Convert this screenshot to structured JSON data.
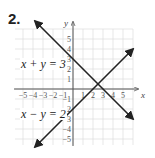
{
  "problem_number": "2.",
  "chart_data": {
    "type": "line",
    "title": "",
    "xlabel": "x",
    "ylabel": "y",
    "xlim": [
      -6,
      6
    ],
    "ylim": [
      -6,
      6
    ],
    "grid": true,
    "x_ticks": [
      -5,
      -4,
      -3,
      -2,
      -1,
      1,
      2,
      3,
      4,
      5
    ],
    "y_ticks": [
      -5,
      -4,
      -3,
      -2,
      -1,
      1,
      2,
      3,
      4,
      5
    ],
    "series": [
      {
        "name": "x + y = 3",
        "x": [
          -3.8,
          6
        ],
        "y": [
          6.8,
          -3
        ],
        "arrows": "both"
      },
      {
        "name": "x - y = 2",
        "x": [
          -3.8,
          6
        ],
        "y": [
          -5.8,
          4
        ],
        "arrows": "both"
      }
    ],
    "intersection": {
      "x": 2.5,
      "y": 0.5
    },
    "annotations": [
      {
        "text": "x + y = 3",
        "x": -5,
        "y": 2.3
      },
      {
        "text": "x − y = 2",
        "x": -5,
        "y": -2.5
      }
    ]
  },
  "labels": {
    "eq1": "x + y = 3",
    "eq2": "x − y = 2",
    "x_axis": "x",
    "y_axis": "y"
  }
}
